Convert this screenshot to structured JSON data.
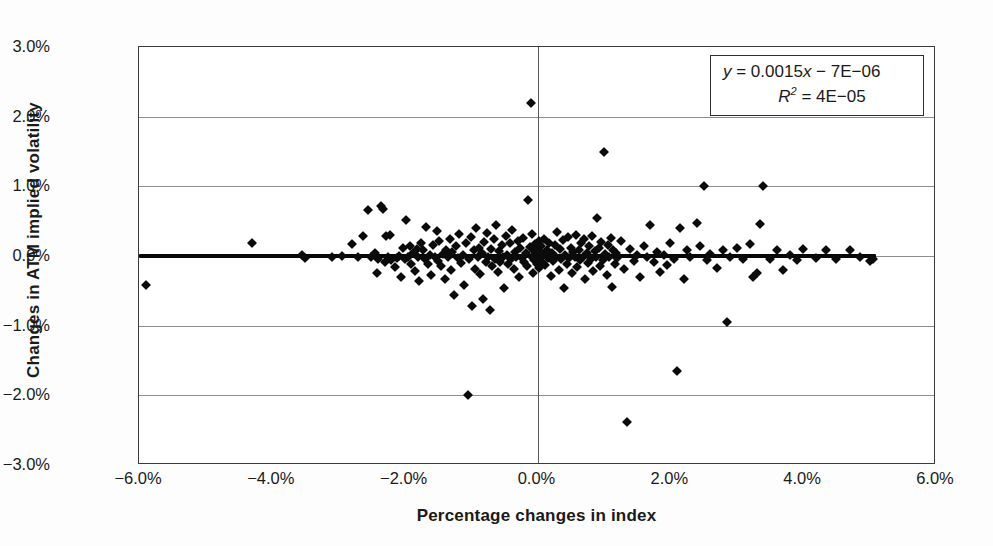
{
  "chart_data": {
    "type": "scatter",
    "title": "",
    "xlabel": "Percentage changes in index",
    "ylabel": "Changes in ATM implied volatility",
    "xlim": [
      -6.0,
      6.0
    ],
    "ylim": [
      -3.0,
      3.0
    ],
    "xticks": [
      "-6.0%",
      "-4.0%",
      "-2.0%",
      "0.0%",
      "2.0%",
      "4.0%",
      "6.0%"
    ],
    "xtick_values": [
      -6.0,
      -4.0,
      -2.0,
      0.0,
      2.0,
      4.0,
      6.0
    ],
    "yticks": [
      "3.0%",
      "2.0%",
      "1.0%",
      "0.0%",
      "-1.0%",
      "-2.0%",
      "-3.0%"
    ],
    "ytick_values": [
      3.0,
      2.0,
      1.0,
      0.0,
      -1.0,
      -2.0,
      -3.0
    ],
    "grid": "horizontal-gridlines-only",
    "legend": "none",
    "annotations": {
      "equation_line1": "y = 0.0015x − 7E−06",
      "equation_line2_prefix": "R",
      "equation_line2_sup": "2",
      "equation_line2_rest": " = 4E−05",
      "slope": 0.0015,
      "intercept": -7e-06,
      "r_squared": 4e-05,
      "position": "top-right"
    },
    "trendline": {
      "from_x": -6.0,
      "to_x": 5.1,
      "y_at_zero": 0.0
    },
    "series": [
      {
        "name": "Daily observations",
        "marker": "diamond",
        "color": "#0b0b0b",
        "points": [
          [
            -5.9,
            -0.42
          ],
          [
            -4.3,
            0.18
          ],
          [
            -3.55,
            0.02
          ],
          [
            -3.5,
            -0.03
          ],
          [
            -3.1,
            -0.02
          ],
          [
            -2.95,
            0.0
          ],
          [
            -2.8,
            0.17
          ],
          [
            -2.7,
            -0.01
          ],
          [
            -2.62,
            0.28
          ],
          [
            -2.55,
            0.66
          ],
          [
            -2.5,
            -0.02
          ],
          [
            -2.45,
            0.05
          ],
          [
            -2.42,
            -0.25
          ],
          [
            -2.4,
            -0.04
          ],
          [
            -2.35,
            0.72
          ],
          [
            -2.33,
            0.68
          ],
          [
            -2.3,
            -0.08
          ],
          [
            -2.28,
            0.28
          ],
          [
            -2.25,
            -0.01
          ],
          [
            -2.22,
            0.3
          ],
          [
            -2.2,
            -0.06
          ],
          [
            -2.15,
            -0.16
          ],
          [
            -2.12,
            -0.03
          ],
          [
            -2.08,
            0.0
          ],
          [
            -2.05,
            -0.3
          ],
          [
            -2.02,
            0.12
          ],
          [
            -2.0,
            -0.05
          ],
          [
            -1.98,
            0.52
          ],
          [
            -1.95,
            -0.02
          ],
          [
            -1.92,
            0.15
          ],
          [
            -1.9,
            -0.11
          ],
          [
            -1.88,
            0.04
          ],
          [
            -1.85,
            -0.22
          ],
          [
            -1.82,
            0.1
          ],
          [
            -1.8,
            -0.02
          ],
          [
            -1.78,
            -0.36
          ],
          [
            -1.75,
            0.18
          ],
          [
            -1.72,
            0.08
          ],
          [
            -1.7,
            -0.04
          ],
          [
            -1.68,
            0.41
          ],
          [
            -1.65,
            -0.12
          ],
          [
            -1.62,
            0.02
          ],
          [
            -1.6,
            -0.27
          ],
          [
            -1.58,
            0.16
          ],
          [
            -1.55,
            -0.02
          ],
          [
            -1.52,
            0.36
          ],
          [
            -1.5,
            -0.07
          ],
          [
            -1.48,
            0.22
          ],
          [
            -1.45,
            -0.15
          ],
          [
            -1.42,
            0.03
          ],
          [
            -1.4,
            -0.33
          ],
          [
            -1.38,
            0.09
          ],
          [
            -1.35,
            -0.01
          ],
          [
            -1.32,
            0.25
          ],
          [
            -1.3,
            -0.2
          ],
          [
            -1.28,
            0.06
          ],
          [
            -1.25,
            -0.56
          ],
          [
            -1.22,
            0.14
          ],
          [
            -1.2,
            -0.03
          ],
          [
            -1.18,
            0.31
          ],
          [
            -1.15,
            -0.1
          ],
          [
            -1.12,
            0.01
          ],
          [
            -1.1,
            -0.42
          ],
          [
            -1.08,
            0.19
          ],
          [
            -1.05,
            -2.0
          ],
          [
            -1.03,
            -0.05
          ],
          [
            -1.0,
            0.27
          ],
          [
            -0.98,
            -0.72
          ],
          [
            -0.96,
            0.08
          ],
          [
            -0.94,
            -0.18
          ],
          [
            -0.92,
            0.4
          ],
          [
            -0.9,
            -0.02
          ],
          [
            -0.88,
            0.12
          ],
          [
            -0.86,
            -0.26
          ],
          [
            -0.84,
            0.05
          ],
          [
            -0.82,
            -0.62
          ],
          [
            -0.8,
            0.2
          ],
          [
            -0.78,
            -0.08
          ],
          [
            -0.76,
            0.33
          ],
          [
            -0.74,
            -0.01
          ],
          [
            -0.72,
            -0.78
          ],
          [
            -0.7,
            0.1
          ],
          [
            -0.68,
            -0.14
          ],
          [
            -0.66,
            0.24
          ],
          [
            -0.64,
            -0.04
          ],
          [
            -0.62,
            0.44
          ],
          [
            -0.6,
            -0.23
          ],
          [
            -0.58,
            0.07
          ],
          [
            -0.56,
            -0.09
          ],
          [
            -0.54,
            0.16
          ],
          [
            -0.52,
            -0.02
          ],
          [
            -0.5,
            -0.46
          ],
          [
            -0.48,
            0.29
          ],
          [
            -0.46,
            0.02
          ],
          [
            -0.44,
            -0.12
          ],
          [
            -0.42,
            0.18
          ],
          [
            -0.4,
            -0.05
          ],
          [
            -0.38,
            0.38
          ],
          [
            -0.36,
            -0.19
          ],
          [
            -0.34,
            0.06
          ],
          [
            -0.32,
            -0.01
          ],
          [
            -0.3,
            0.22
          ],
          [
            -0.28,
            -0.3
          ],
          [
            -0.26,
            0.11
          ],
          [
            -0.24,
            -0.03
          ],
          [
            -0.22,
            0.26
          ],
          [
            -0.2,
            -0.08
          ],
          [
            -0.18,
            0.04
          ],
          [
            -0.16,
            -0.15
          ],
          [
            -0.14,
            0.8
          ],
          [
            -0.12,
            0.13
          ],
          [
            -0.1,
            2.2
          ],
          [
            -0.09,
            -0.02
          ],
          [
            -0.08,
            0.31
          ],
          [
            -0.07,
            -0.24
          ],
          [
            -0.06,
            0.07
          ],
          [
            -0.05,
            -0.06
          ],
          [
            -0.04,
            0.17
          ],
          [
            -0.03,
            -0.01
          ],
          [
            -0.02,
            0.09
          ],
          [
            -0.01,
            -0.11
          ],
          [
            0.0,
            0.03
          ],
          [
            0.01,
            -0.04
          ],
          [
            0.02,
            0.21
          ],
          [
            0.03,
            -0.17
          ],
          [
            0.04,
            0.06
          ],
          [
            0.05,
            -0.02
          ],
          [
            0.06,
            0.14
          ],
          [
            0.07,
            -0.09
          ],
          [
            0.08,
            0.01
          ],
          [
            0.1,
            0.25
          ],
          [
            0.12,
            -0.13
          ],
          [
            0.14,
            0.08
          ],
          [
            0.16,
            -0.03
          ],
          [
            0.18,
            0.19
          ],
          [
            0.2,
            -0.28
          ],
          [
            0.22,
            0.05
          ],
          [
            0.24,
            -0.07
          ],
          [
            0.26,
            0.16
          ],
          [
            0.28,
            -0.01
          ],
          [
            0.3,
            0.34
          ],
          [
            0.32,
            -0.2
          ],
          [
            0.34,
            0.1
          ],
          [
            0.36,
            -0.05
          ],
          [
            0.38,
            0.23
          ],
          [
            0.4,
            -0.46
          ],
          [
            0.42,
            0.02
          ],
          [
            0.44,
            -0.12
          ],
          [
            0.46,
            0.27
          ],
          [
            0.48,
            -0.03
          ],
          [
            0.5,
            0.12
          ],
          [
            0.52,
            -0.25
          ],
          [
            0.54,
            0.06
          ],
          [
            0.56,
            -0.01
          ],
          [
            0.58,
            0.3
          ],
          [
            0.6,
            -0.16
          ],
          [
            0.62,
            0.09
          ],
          [
            0.64,
            -0.06
          ],
          [
            0.66,
            0.18
          ],
          [
            0.68,
            -0.02
          ],
          [
            0.7,
            0.24
          ],
          [
            0.72,
            -0.33
          ],
          [
            0.74,
            0.04
          ],
          [
            0.76,
            -0.1
          ],
          [
            0.78,
            0.14
          ],
          [
            0.8,
            -0.04
          ],
          [
            0.82,
            0.28
          ],
          [
            0.84,
            -0.21
          ],
          [
            0.86,
            0.07
          ],
          [
            0.88,
            -0.02
          ],
          [
            0.9,
            0.54
          ],
          [
            0.92,
            0.11
          ],
          [
            0.94,
            -0.14
          ],
          [
            0.96,
            0.2
          ],
          [
            0.98,
            -0.06
          ],
          [
            1.0,
            1.5
          ],
          [
            1.02,
            0.03
          ],
          [
            1.04,
            -0.27
          ],
          [
            1.06,
            0.16
          ],
          [
            1.08,
            -0.01
          ],
          [
            1.1,
            0.26
          ],
          [
            1.12,
            -0.44
          ],
          [
            1.14,
            0.08
          ],
          [
            1.16,
            -0.12
          ],
          [
            1.18,
            0.05
          ],
          [
            1.2,
            -0.03
          ],
          [
            1.25,
            0.22
          ],
          [
            1.3,
            -0.18
          ],
          [
            1.35,
            -2.38
          ],
          [
            1.4,
            0.1
          ],
          [
            1.45,
            -0.07
          ],
          [
            1.5,
            0.02
          ],
          [
            1.55,
            -0.3
          ],
          [
            1.6,
            0.15
          ],
          [
            1.65,
            -0.02
          ],
          [
            1.7,
            0.44
          ],
          [
            1.75,
            -0.09
          ],
          [
            1.8,
            0.06
          ],
          [
            1.85,
            -0.23
          ],
          [
            1.9,
            0.01
          ],
          [
            1.95,
            -0.13
          ],
          [
            2.0,
            0.18
          ],
          [
            2.05,
            -0.04
          ],
          [
            2.1,
            -1.65
          ],
          [
            2.15,
            0.4
          ],
          [
            2.2,
            -0.33
          ],
          [
            2.25,
            0.09
          ],
          [
            2.3,
            -0.02
          ],
          [
            2.4,
            0.48
          ],
          [
            2.45,
            0.14
          ],
          [
            2.5,
            1.0
          ],
          [
            2.55,
            -0.06
          ],
          [
            2.6,
            0.03
          ],
          [
            2.7,
            -0.17
          ],
          [
            2.8,
            0.08
          ],
          [
            2.85,
            -0.95
          ],
          [
            2.9,
            -0.02
          ],
          [
            3.0,
            0.11
          ],
          [
            3.1,
            -0.05
          ],
          [
            3.2,
            0.17
          ],
          [
            3.25,
            -0.3
          ],
          [
            3.3,
            -0.24
          ],
          [
            3.35,
            0.46
          ],
          [
            3.4,
            1.0
          ],
          [
            3.5,
            -0.04
          ],
          [
            3.6,
            0.09
          ],
          [
            3.7,
            -0.2
          ],
          [
            3.8,
            0.02
          ],
          [
            3.9,
            -0.06
          ],
          [
            4.0,
            0.1
          ],
          [
            4.2,
            -0.03
          ],
          [
            4.35,
            0.08
          ],
          [
            4.5,
            -0.05
          ],
          [
            4.7,
            0.09
          ],
          [
            4.85,
            -0.02
          ],
          [
            5.0,
            -0.07
          ],
          [
            5.05,
            -0.04
          ]
        ]
      }
    ]
  }
}
